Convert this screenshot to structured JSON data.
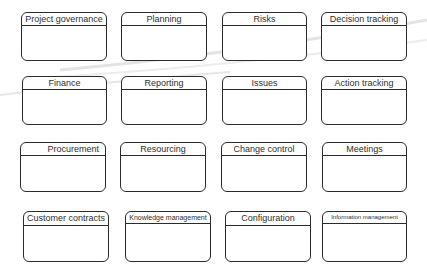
{
  "diagram": {
    "type": "module-grid",
    "colors": {
      "border": "#2b2b2b",
      "text": "#2e2e2e",
      "background": "#ffffff",
      "swoosh": "#d9d9d9"
    },
    "rows": [
      {
        "boxes": [
          {
            "label": "Project governance"
          },
          {
            "label": "Planning"
          },
          {
            "label": "Risks"
          },
          {
            "label": "Decision tracking"
          }
        ]
      },
      {
        "boxes": [
          {
            "label": "Finance"
          },
          {
            "label": "Reporting"
          },
          {
            "label": "Issues"
          },
          {
            "label": "Action tracking"
          }
        ]
      },
      {
        "boxes": [
          {
            "label": "Procurement"
          },
          {
            "label": "Resourcing"
          },
          {
            "label": "Change control"
          },
          {
            "label": "Meetings"
          }
        ]
      },
      {
        "boxes": [
          {
            "label": "Customer contracts"
          },
          {
            "label": "Knowledge management"
          },
          {
            "label": "Configuration"
          },
          {
            "label": "Information management"
          }
        ]
      }
    ]
  }
}
